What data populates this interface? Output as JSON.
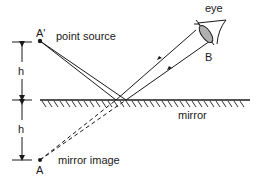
{
  "diagram": {
    "labels": {
      "eye": "eye",
      "source_point": "A'",
      "source_text": "point source",
      "eye_point": "B",
      "mirror": "mirror",
      "image_point": "A",
      "image_text": "mirror image",
      "height_upper": "h",
      "height_lower": "h"
    },
    "colors": {
      "line": "#1a1a1a",
      "lens": "#b0b0b0"
    }
  }
}
